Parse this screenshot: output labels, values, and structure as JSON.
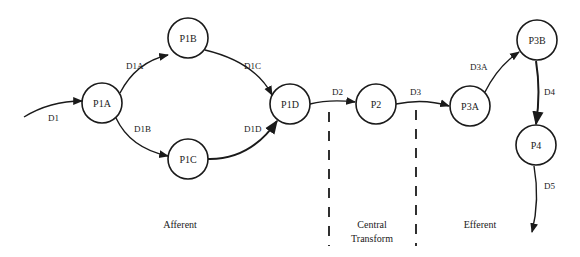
{
  "diagram": {
    "type": "data-flow diagram",
    "nodes": [
      {
        "id": "P1A",
        "label": "P1A",
        "cx": 102,
        "cy": 103
      },
      {
        "id": "P1B",
        "label": "P1B",
        "cx": 188,
        "cy": 38
      },
      {
        "id": "P1C",
        "label": "P1C",
        "cx": 188,
        "cy": 159
      },
      {
        "id": "P1D",
        "label": "P1D",
        "cx": 290,
        "cy": 104
      },
      {
        "id": "P2",
        "label": "P2",
        "cx": 376,
        "cy": 104
      },
      {
        "id": "P3A",
        "label": "P3A",
        "cx": 470,
        "cy": 106
      },
      {
        "id": "P3B",
        "label": "P3B",
        "cx": 537,
        "cy": 40
      },
      {
        "id": "P4",
        "label": "P4",
        "cx": 536,
        "cy": 145
      }
    ],
    "edges": [
      {
        "id": "D1",
        "label": "D1",
        "from": "external",
        "to": "P1A"
      },
      {
        "id": "D1A",
        "label": "D1A",
        "from": "P1A",
        "to": "P1B"
      },
      {
        "id": "D1B",
        "label": "D1B",
        "from": "P1A",
        "to": "P1C"
      },
      {
        "id": "D1C",
        "label": "D1C",
        "from": "P1B",
        "to": "P1D"
      },
      {
        "id": "D1D",
        "label": "D1D",
        "from": "P1C",
        "to": "P1D"
      },
      {
        "id": "D2",
        "label": "D2",
        "from": "P1D",
        "to": "P2"
      },
      {
        "id": "D3",
        "label": "D3",
        "from": "P2",
        "to": "P3A"
      },
      {
        "id": "D3A",
        "label": "D3A",
        "from": "P3A",
        "to": "P3B"
      },
      {
        "id": "D4",
        "label": "D4",
        "from": "P3B",
        "to": "P4"
      },
      {
        "id": "D5",
        "label": "D5",
        "from": "P4",
        "to": "external"
      }
    ],
    "regions": {
      "afferent": "Afferent",
      "central_line1": "Central",
      "central_line2": "Transform",
      "efferent": "Efferent"
    }
  }
}
